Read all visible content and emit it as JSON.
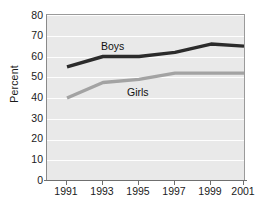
{
  "chart_data": {
    "type": "line",
    "title": "",
    "xlabel": "",
    "ylabel": "Percent",
    "categories": [
      "1991",
      "1993",
      "1995",
      "1997",
      "1999",
      "2001"
    ],
    "x": [
      1991,
      1993,
      1995,
      1997,
      1999,
      2001
    ],
    "ylim": [
      0,
      80
    ],
    "xlim": [
      1991,
      2001
    ],
    "yticks": [
      0,
      10,
      20,
      30,
      40,
      50,
      60,
      70,
      80
    ],
    "grid": true,
    "legend": "inline-labels",
    "series": [
      {
        "name": "Boys",
        "color": "#2b2b2b",
        "values": [
          55,
          60,
          60,
          62,
          66,
          65
        ]
      },
      {
        "name": "Girls",
        "color": "#a3a3a3",
        "values": [
          40,
          47.5,
          49,
          52,
          52,
          52
        ]
      }
    ],
    "annotations": [
      {
        "text": "Boys",
        "series": "Boys"
      },
      {
        "text": "Girls",
        "series": "Girls"
      }
    ]
  },
  "axis": {
    "y_tick_labels": [
      "80",
      "70",
      "60",
      "50",
      "40",
      "30",
      "20",
      "10",
      "0"
    ],
    "x_tick_labels": [
      "1991",
      "1993",
      "1995",
      "1997",
      "1999",
      "2001"
    ],
    "y_title": "Percent"
  },
  "colors": {
    "plot_background": "#e9e9e9",
    "gridline": "#ffffff",
    "axis": "#6f6f6f",
    "boys_line": "#2b2b2b",
    "girls_line": "#a3a3a3",
    "text": "#1a1a1a"
  }
}
